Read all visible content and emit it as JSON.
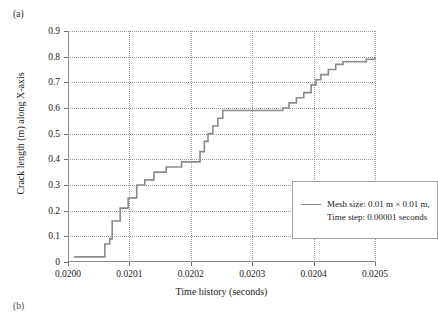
{
  "figure": {
    "panel_label_a": "(a)",
    "panel_label_b": "(b)"
  },
  "chart_data": {
    "type": "line",
    "title": "",
    "xlabel": "Time history (seconds)",
    "ylabel": "Crack length (m) along X-axis",
    "xlim": [
      0.02,
      0.0205
    ],
    "ylim": [
      0,
      0.9
    ],
    "grid": true,
    "legend_position": "center-right",
    "line_color": "#8a8a8a",
    "xticks": [
      "0.0200",
      "0.0201",
      "0.0202",
      "0.0203",
      "0.0204",
      "0.0205"
    ],
    "xtick_values": [
      0.02,
      0.0201,
      0.0202,
      0.0203,
      0.0204,
      0.0205
    ],
    "yticks": [
      "0",
      "0.1",
      "0.2",
      "0.3",
      "0.4",
      "0.5",
      "0.6",
      "0.7",
      "0.8",
      "0.9"
    ],
    "ytick_values": [
      0,
      0.1,
      0.2,
      0.3,
      0.4,
      0.5,
      0.6,
      0.7,
      0.8,
      0.9
    ],
    "series": [
      {
        "name": "Mesh size: 0.01 m x 0.01 m, Time step: 0.00001 seconds",
        "drawstyle": "steps-post",
        "x": [
          0.02001,
          0.020048,
          0.02006,
          0.020068,
          0.020072,
          0.020078,
          0.020085,
          0.020098,
          0.020112,
          0.020125,
          0.02014,
          0.02016,
          0.020185,
          0.02021,
          0.020215,
          0.020222,
          0.020228,
          0.020236,
          0.020244,
          0.020252,
          0.0203,
          0.02035,
          0.02036,
          0.020372,
          0.020384,
          0.020396,
          0.020404,
          0.020412,
          0.020424,
          0.020436,
          0.020448,
          0.020462,
          0.020486,
          0.0205
        ],
        "y": [
          0.02,
          0.02,
          0.07,
          0.09,
          0.16,
          0.16,
          0.21,
          0.25,
          0.3,
          0.32,
          0.35,
          0.37,
          0.39,
          0.39,
          0.43,
          0.47,
          0.5,
          0.53,
          0.56,
          0.59,
          0.59,
          0.6,
          0.62,
          0.64,
          0.66,
          0.69,
          0.71,
          0.73,
          0.75,
          0.77,
          0.78,
          0.78,
          0.79,
          0.8
        ]
      }
    ],
    "legend": {
      "line_1": "Mesh size: 0.01 m × 0.01 m,",
      "line_2": "Time step: 0.00001 seconds"
    }
  }
}
